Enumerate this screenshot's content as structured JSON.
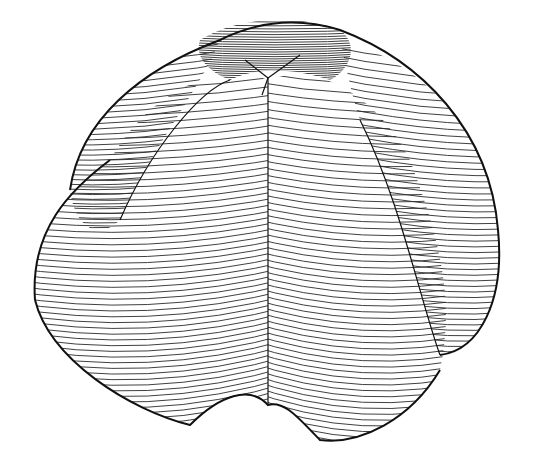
{
  "figure": {
    "background": "#ffffff",
    "line_color": "#2a2a2a",
    "outline_color": "#111111",
    "lobes": [
      {
        "name": "back-left",
        "contours": 40
      },
      {
        "name": "back-right",
        "contours": 40
      },
      {
        "name": "right",
        "contours": 55
      },
      {
        "name": "front-left",
        "contours": 60
      },
      {
        "name": "front-right",
        "contours": 60
      }
    ]
  }
}
